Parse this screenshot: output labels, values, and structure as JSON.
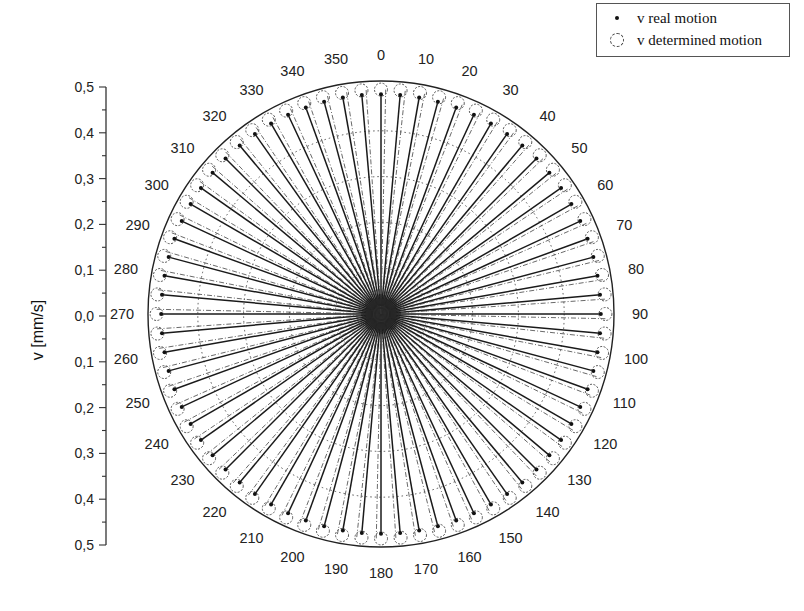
{
  "chart_data": {
    "type": "polar-scatter",
    "title": "",
    "ylabel": "v [mm/s]",
    "radial_axis": {
      "label": "v [mm/s]",
      "range": [
        0.0,
        0.5
      ],
      "ticks_upper": [
        "0,5",
        "0,4",
        "0,3",
        "0,2",
        "0,1",
        "0,0"
      ],
      "ticks_lower": [
        "0,1",
        "0,2",
        "0,3",
        "0,4",
        "0,5"
      ],
      "grid_rings": [
        0.1,
        0.2,
        0.3,
        0.4
      ],
      "grid_style": "dotted"
    },
    "angular_axis": {
      "unit": "degrees",
      "direction": "clockwise",
      "zero_at": "top",
      "tick_labels": [
        "0",
        "10",
        "20",
        "30",
        "40",
        "50",
        "60",
        "70",
        "80",
        "90",
        "100",
        "110",
        "120",
        "130",
        "140",
        "150",
        "160",
        "170",
        "180",
        "190",
        "200",
        "210",
        "220",
        "230",
        "240",
        "250",
        "260",
        "270",
        "280",
        "290",
        "300",
        "310",
        "320",
        "330",
        "340",
        "350"
      ]
    },
    "legend": {
      "position": "top-right",
      "entries": [
        {
          "label": "v real motion",
          "marker": "filled-dot"
        },
        {
          "label": "v determined motion",
          "marker": "open-dashed-circle"
        }
      ]
    },
    "series": [
      {
        "name": "v real motion",
        "angle_step_deg": 5,
        "angles_deg": [
          0,
          5,
          10,
          15,
          20,
          25,
          30,
          35,
          40,
          45,
          50,
          55,
          60,
          65,
          70,
          75,
          80,
          85,
          90,
          95,
          100,
          105,
          110,
          115,
          120,
          125,
          130,
          135,
          140,
          145,
          150,
          155,
          160,
          165,
          170,
          175,
          180,
          185,
          190,
          195,
          200,
          205,
          210,
          215,
          220,
          225,
          230,
          235,
          240,
          245,
          250,
          255,
          260,
          265,
          270,
          275,
          280,
          285,
          290,
          295,
          300,
          305,
          310,
          315,
          320,
          325,
          330,
          335,
          340,
          345,
          350,
          355
        ],
        "value_mm_s": 0.48
      },
      {
        "name": "v determined motion",
        "angle_step_deg": 5,
        "angles_deg": [
          0,
          5,
          10,
          15,
          20,
          25,
          30,
          35,
          40,
          45,
          50,
          55,
          60,
          65,
          70,
          75,
          80,
          85,
          90,
          95,
          100,
          105,
          110,
          115,
          120,
          125,
          130,
          135,
          140,
          145,
          150,
          155,
          160,
          165,
          170,
          175,
          180,
          185,
          190,
          195,
          200,
          205,
          210,
          215,
          220,
          225,
          230,
          235,
          240,
          245,
          250,
          255,
          260,
          265,
          270,
          275,
          280,
          285,
          290,
          295,
          300,
          305,
          310,
          315,
          320,
          325,
          330,
          335,
          340,
          345,
          350,
          355
        ],
        "value_mm_s": 0.49
      }
    ]
  },
  "legend": {
    "entries": [
      {
        "label": "v real motion"
      },
      {
        "label": "v determined motion"
      }
    ]
  },
  "axis": {
    "ylabel": "v [mm/s]"
  }
}
